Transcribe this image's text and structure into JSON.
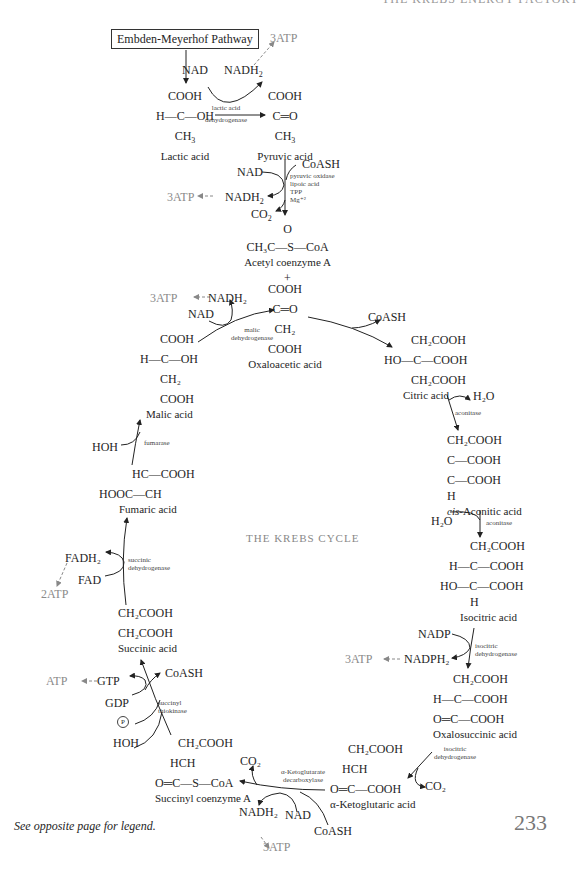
{
  "page": {
    "header": "THE KREBS ENERGY FACTORY",
    "page_number": "233",
    "legend_note": "See opposite page for legend.",
    "center_title": "THE KREBS CYCLE"
  },
  "glycolysis": {
    "box": "Embden-Meyerhof Pathway",
    "nad": "NAD",
    "nadh2": "NADH",
    "atp": "3ATP",
    "enzyme_line1": "lactic acid",
    "enzyme_line2": "dehydrogenase",
    "lactic": {
      "top": "COOH",
      "mid": "H—C—OH",
      "bot": "CH",
      "name": "Lactic acid"
    },
    "pyruvic": {
      "top": "COOH",
      "mid": "C═O",
      "bot": "CH",
      "name": "Pyruvic acid"
    }
  },
  "pyruvate_oxidation": {
    "coash": "CoASH",
    "nad": "NAD",
    "nadh2": "NADH",
    "atp": "3ATP",
    "co2": "CO",
    "cofactors": [
      "pyruvic oxidase",
      "lipoic acid",
      "TPP",
      "Mg⁺²"
    ],
    "acetyl": {
      "top": "O",
      "mid": "CH₃C—S—CoA",
      "name": "Acetyl coenzyme A"
    },
    "plus": "+"
  },
  "oxaloacetic": {
    "lines": [
      "COOH",
      "C═O",
      "CH₂",
      "COOH"
    ],
    "name": "Oxaloacetic acid"
  },
  "citric": {
    "coash": "CoASH",
    "lines": [
      "CH₂COOH",
      "HO—C—COOH",
      "CH₂COOH"
    ],
    "name": "Citric acid",
    "h2o": "H₂O",
    "enzyme": "aconitase"
  },
  "cis_aconitic": {
    "lines": [
      "CH₂COOH",
      "C—COOH",
      "C—COOH",
      "H"
    ],
    "name_italic": "cis",
    "name_rest": "-Aconitic acid",
    "h2o": "H₂O",
    "enzyme": "aconitase"
  },
  "isocitric": {
    "lines": [
      "CH₂COOH",
      "H—C—COOH",
      "HO—C—COOH",
      "H"
    ],
    "name": "Isocitric acid",
    "nadp": "NADP",
    "nadph2": "NADPH₂",
    "atp": "3ATP",
    "enzyme_line1": "isocitric",
    "enzyme_line2": "dehydrogenase"
  },
  "oxalosuccinic": {
    "lines": [
      "CH₂COOH",
      "H—C—COOH",
      "O═C—COOH"
    ],
    "name": "Oxalosuccinic acid",
    "enzyme_line1": "isocitric",
    "enzyme_line2": "dehydrogenase",
    "co2": "CO₂"
  },
  "ketoglutaric": {
    "lines": [
      "CH₂COOH",
      "HCH",
      "O═C—COOH"
    ],
    "name": "α-Ketoglutaric acid",
    "enzyme_line1": "α-Ketoglutarate",
    "enzyme_line2": "decarboxylase",
    "co2": "CO₂",
    "nadh2": "NADH₂",
    "nad": "NAD",
    "coash": "CoASH",
    "atp": "3ATP"
  },
  "succinyl_coa": {
    "lines": [
      "CH₂COOH",
      "HCH",
      "O═C—S—CoA"
    ],
    "name": "Succinyl coenzyme A",
    "coash": "CoASH",
    "gtp": "GTP",
    "atp": "ATP",
    "gdp": "GDP",
    "phosphate": "P",
    "hoh": "HOH",
    "enzyme_line1": "succinyl",
    "enzyme_line2": "thiokinase"
  },
  "succinic": {
    "lines": [
      "CH₂COOH",
      "CH₂COOH"
    ],
    "name": "Succinic acid",
    "fadh2": "FADH₂",
    "fad": "FAD",
    "atp": "2ATP",
    "enzyme_line1": "succinic",
    "enzyme_line2": "dehydrogenase"
  },
  "fumaric": {
    "lines": [
      "HC—COOH",
      "HOOC—CH"
    ],
    "name": "Fumaric acid",
    "hoh": "HOH",
    "enzyme": "fumarase"
  },
  "malic": {
    "lines": [
      "COOH",
      "H—C—OH",
      "CH₂",
      "COOH"
    ],
    "name": "Malic acid",
    "nad": "NAD",
    "nadh2": "NADH₂",
    "atp": "3ATP",
    "enzyme_line1": "malic",
    "enzyme_line2": "dehydrogenase"
  }
}
